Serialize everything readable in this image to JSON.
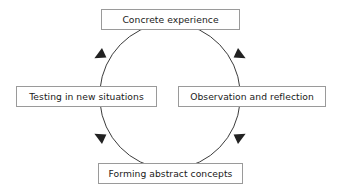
{
  "diagram": {
    "type": "cyclical-process-diagram",
    "direction": "clockwise",
    "background_color": "#ffffff",
    "box_border_color": "#9a9a9a",
    "arc_color": "#3b3b3b",
    "text_color": "#1a1a1a",
    "nodes": [
      {
        "id": "concrete-experience",
        "label": "Concrete experience",
        "position": "top"
      },
      {
        "id": "observation-and-reflection",
        "label": "Observation and reflection",
        "position": "right"
      },
      {
        "id": "forming-abstract-concepts",
        "label": "Forming abstract concepts",
        "position": "bottom"
      },
      {
        "id": "testing-in-new-situations",
        "label": "Testing in new situations",
        "position": "left"
      }
    ],
    "connectors": [
      {
        "id": "arc-top-right",
        "from": "concrete-experience",
        "to": "observation-and-reflection",
        "arrowhead": "down-right"
      },
      {
        "id": "arc-bottom-right",
        "from": "observation-and-reflection",
        "to": "forming-abstract-concepts",
        "arrowhead": "down-left"
      },
      {
        "id": "arc-bottom-left",
        "from": "forming-abstract-concepts",
        "to": "testing-in-new-situations",
        "arrowhead": "up-left"
      },
      {
        "id": "arc-top-left",
        "from": "testing-in-new-situations",
        "to": "concrete-experience",
        "arrowhead": "up-right"
      }
    ]
  }
}
